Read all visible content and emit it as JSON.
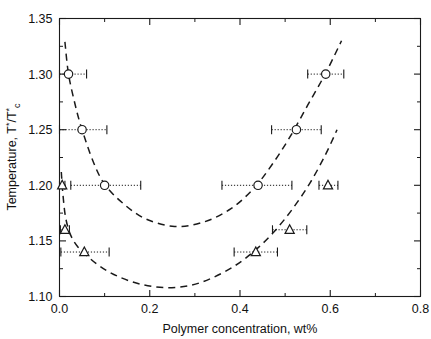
{
  "chart_data": {
    "type": "scatter",
    "title": "",
    "xlabel": "Polymer concentration, wt%",
    "ylabel": "Temperature, T*/T*c",
    "ylabel_parts": {
      "prefix": "Temperature, T",
      "star1": "*",
      "slash": "/T",
      "star2": "*",
      "subscript": "c"
    },
    "xlim": [
      0.0,
      0.8
    ],
    "ylim": [
      1.1,
      1.35
    ],
    "xticks": [
      0.0,
      0.2,
      0.4,
      0.6,
      0.8
    ],
    "xtick_labels": [
      "0.0",
      "0.2",
      "0.4",
      "0.6",
      "0.8"
    ],
    "xminor_step": 0.1,
    "yticks": [
      1.1,
      1.15,
      1.2,
      1.25,
      1.3,
      1.35
    ],
    "ytick_labels": [
      "1.10",
      "1.15",
      "1.20",
      "1.25",
      "1.30",
      "1.35"
    ],
    "yminor_step": 0.025,
    "grid": false,
    "legend": "none",
    "frame": true,
    "series": [
      {
        "name": "circle-series",
        "marker": "circle",
        "marker_filled": false,
        "linestyle": "dashed",
        "color": "#000000",
        "points": [
          {
            "x": 0.02,
            "y": 1.3,
            "xerr_low": 0.02,
            "xerr_high": 0.04
          },
          {
            "x": 0.05,
            "y": 1.25,
            "xerr_low": 0.05,
            "xerr_high": 0.055
          },
          {
            "x": 0.1,
            "y": 1.2,
            "xerr_low": 0.075,
            "xerr_high": 0.08
          },
          {
            "x": 0.44,
            "y": 1.2,
            "xerr_low": 0.08,
            "xerr_high": 0.075
          },
          {
            "x": 0.525,
            "y": 1.25,
            "xerr_low": 0.055,
            "xerr_high": 0.055
          },
          {
            "x": 0.59,
            "y": 1.3,
            "xerr_low": 0.04,
            "xerr_high": 0.04
          }
        ],
        "curve_min": {
          "x": 0.255,
          "y": 1.163
        }
      },
      {
        "name": "triangle-series",
        "marker": "triangle-up",
        "marker_filled": false,
        "linestyle": "dashed",
        "color": "#000000",
        "points": [
          {
            "x": 0.006,
            "y": 1.2,
            "xerr_low": 0.006,
            "xerr_high": 0.006
          },
          {
            "x": 0.012,
            "y": 1.16,
            "xerr_low": 0.01,
            "xerr_high": 0.01
          },
          {
            "x": 0.055,
            "y": 1.14,
            "xerr_low": 0.052,
            "xerr_high": 0.055
          },
          {
            "x": 0.435,
            "y": 1.14,
            "xerr_low": 0.048,
            "xerr_high": 0.048
          },
          {
            "x": 0.51,
            "y": 1.16,
            "xerr_low": 0.038,
            "xerr_high": 0.038
          },
          {
            "x": 0.595,
            "y": 1.2,
            "xerr_low": 0.02,
            "xerr_high": 0.022
          }
        ],
        "curve_min": {
          "x": 0.235,
          "y": 1.108
        }
      }
    ],
    "curves": [
      {
        "name": "upper-dashed-curve",
        "for_series": "circle-series",
        "path_points": [
          {
            "x": 0.012,
            "y": 1.329
          },
          {
            "x": 0.02,
            "y": 1.3
          },
          {
            "x": 0.035,
            "y": 1.272
          },
          {
            "x": 0.05,
            "y": 1.25
          },
          {
            "x": 0.075,
            "y": 1.221
          },
          {
            "x": 0.1,
            "y": 1.201
          },
          {
            "x": 0.14,
            "y": 1.184
          },
          {
            "x": 0.19,
            "y": 1.17
          },
          {
            "x": 0.255,
            "y": 1.163
          },
          {
            "x": 0.32,
            "y": 1.167
          },
          {
            "x": 0.38,
            "y": 1.179
          },
          {
            "x": 0.43,
            "y": 1.197
          },
          {
            "x": 0.47,
            "y": 1.218
          },
          {
            "x": 0.51,
            "y": 1.243
          },
          {
            "x": 0.55,
            "y": 1.272
          },
          {
            "x": 0.59,
            "y": 1.301
          },
          {
            "x": 0.625,
            "y": 1.33
          }
        ]
      },
      {
        "name": "lower-dashed-curve",
        "for_series": "triangle-series",
        "path_points": [
          {
            "x": 0.004,
            "y": 1.212
          },
          {
            "x": 0.008,
            "y": 1.19
          },
          {
            "x": 0.014,
            "y": 1.17
          },
          {
            "x": 0.025,
            "y": 1.155
          },
          {
            "x": 0.04,
            "y": 1.145
          },
          {
            "x": 0.06,
            "y": 1.137
          },
          {
            "x": 0.09,
            "y": 1.127
          },
          {
            "x": 0.13,
            "y": 1.118
          },
          {
            "x": 0.18,
            "y": 1.111
          },
          {
            "x": 0.235,
            "y": 1.108
          },
          {
            "x": 0.29,
            "y": 1.11
          },
          {
            "x": 0.34,
            "y": 1.117
          },
          {
            "x": 0.39,
            "y": 1.128
          },
          {
            "x": 0.435,
            "y": 1.142
          },
          {
            "x": 0.475,
            "y": 1.158
          },
          {
            "x": 0.515,
            "y": 1.178
          },
          {
            "x": 0.555,
            "y": 1.202
          },
          {
            "x": 0.59,
            "y": 1.228
          },
          {
            "x": 0.615,
            "y": 1.25
          }
        ]
      }
    ]
  }
}
